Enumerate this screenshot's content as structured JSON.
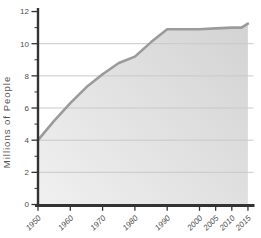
{
  "chart_data": {
    "type": "area",
    "title": "",
    "ylabel": "Millions of People",
    "xlabel": "",
    "xlim": [
      1950,
      2015
    ],
    "ylim": [
      0,
      12
    ],
    "grid": true,
    "legend": false,
    "series": [
      {
        "name": "Millions of People",
        "x": [
          1950,
          1955,
          1960,
          1965,
          1970,
          1975,
          1980,
          1985,
          1990,
          1995,
          2000,
          2005,
          2010,
          2013,
          2015
        ],
        "values": [
          4.0,
          5.2,
          6.3,
          7.3,
          8.1,
          8.8,
          9.2,
          10.1,
          10.9,
          10.9,
          10.9,
          10.95,
          11.0,
          11.0,
          11.25
        ]
      }
    ],
    "x_ticks": [
      {
        "value": 1950,
        "label": "1950"
      },
      {
        "value": 1960,
        "label": "1960"
      },
      {
        "value": 1970,
        "label": "1970"
      },
      {
        "value": 1980,
        "label": "1980"
      },
      {
        "value": 1990,
        "label": "1990"
      },
      {
        "value": 2000,
        "label": "2000"
      },
      {
        "value": 2005,
        "label": "2005"
      },
      {
        "value": 2010,
        "label": "2010"
      },
      {
        "value": 2015,
        "label": "2015"
      }
    ],
    "y_ticks": [
      {
        "value": 0,
        "label": "0"
      },
      {
        "value": 2,
        "label": "2"
      },
      {
        "value": 4,
        "label": "4"
      },
      {
        "value": 6,
        "label": "6"
      },
      {
        "value": 8,
        "label": "8"
      },
      {
        "value": 10,
        "label": "10"
      },
      {
        "value": 12,
        "label": "12"
      }
    ],
    "y_minor_ticks": [
      1,
      3,
      5,
      7,
      9,
      11
    ],
    "grid_values": [
      2,
      4,
      6,
      8,
      10
    ],
    "colors": {
      "background": "#ffffff",
      "area_gradient_start": "#efefef",
      "area_gradient_end": "#d4d4d4",
      "line": "#9b9b9b",
      "grid": "#c9c9c9",
      "axis": "#333333",
      "tick_label": "#4d4d4d",
      "axis_title": "#555555"
    }
  }
}
